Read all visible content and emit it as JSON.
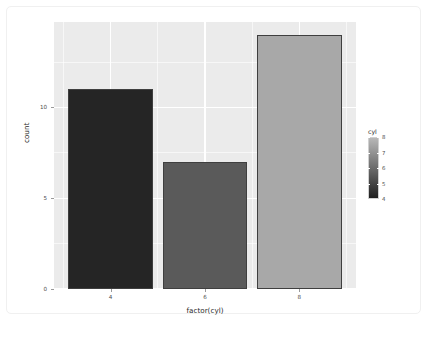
{
  "chart_data": {
    "type": "bar",
    "title": "",
    "subtitle": "",
    "xlabel": "factor(cyl)",
    "ylabel": "count",
    "categories": [
      "4",
      "6",
      "8"
    ],
    "values": [
      11,
      7,
      14
    ],
    "series": [
      {
        "name": "count",
        "values": [
          11,
          7,
          14
        ]
      }
    ],
    "x_tick_labels": [
      "4",
      "6",
      "8"
    ],
    "y_tick_labels": [
      "0",
      "5",
      "10"
    ],
    "y_tick_values": [
      0,
      5,
      10
    ],
    "y_minor_tick_values": [
      2.5,
      7.5,
      12.5
    ],
    "ylim": [
      0,
      14.7
    ],
    "xlim": [
      0.4,
      3.6
    ],
    "grid": true,
    "grid_color": "#ffffff",
    "panel_background": "#ebebeb",
    "plot_background": "#ffffff",
    "legend_position": "right",
    "bar_colors": [
      "#252525",
      "#5a5a5a",
      "#a8a8a8"
    ],
    "bar_outline_color": "#3f3f3f",
    "bar_fill_values": [
      4,
      6,
      8
    ],
    "legend": {
      "title": "cyl",
      "type": "colourbar",
      "tick_labels": [
        "8",
        "7",
        "6",
        "5",
        "4"
      ],
      "tick_values": [
        8,
        7,
        6,
        5,
        4
      ],
      "gradient_top_color": "#b8b8b8",
      "gradient_bottom_color": "#1f1f1f",
      "range": [
        4,
        8
      ]
    }
  },
  "axis": {
    "x_title": "factor(cyl)",
    "y_title": "count"
  }
}
